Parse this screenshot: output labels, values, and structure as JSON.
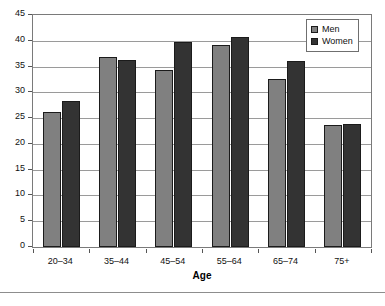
{
  "chart_data": {
    "type": "bar",
    "title": "",
    "subtitle": "",
    "xlabel": "Age",
    "ylabel": "",
    "categories": [
      "20–34",
      "35–44",
      "45–54",
      "55–64",
      "65–74",
      "75+"
    ],
    "series": [
      {
        "name": "Men",
        "color": "#808080",
        "values": [
          26.1,
          36.8,
          34.4,
          39.1,
          32.6,
          23.6
        ]
      },
      {
        "name": "Women",
        "color": "#333333",
        "values": [
          28.4,
          36.3,
          39.8,
          40.7,
          36.0,
          23.8
        ]
      }
    ],
    "ylim": [
      0,
      45
    ],
    "ytick_step": 5,
    "ytick_labels": [
      "45",
      "40",
      "35",
      "30",
      "25",
      "20",
      "15",
      "10",
      "5",
      "0"
    ],
    "ytick_values": [
      45,
      40,
      35,
      30,
      25,
      20,
      15,
      10,
      5,
      0
    ],
    "grid": true,
    "grid_axis": "y",
    "legend_position": "top-right",
    "legend_entries": [
      "Men",
      "Women"
    ]
  },
  "axis": {
    "x_title": "Age"
  },
  "legend": {
    "men_label": "Men",
    "women_label": "Women"
  }
}
